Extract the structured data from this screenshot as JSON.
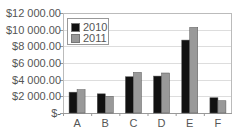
{
  "chart_data": {
    "type": "bar",
    "title": "",
    "xlabel": "",
    "ylabel": "",
    "categories": [
      "A",
      "B",
      "C",
      "D",
      "E",
      "F"
    ],
    "series": [
      {
        "name": "2010",
        "color": "#111111",
        "values": [
          2500,
          2300,
          4350,
          4430,
          8750,
          1830
        ]
      },
      {
        "name": "2011",
        "color": "#999999",
        "values": [
          2800,
          2000,
          4870,
          4800,
          10270,
          1470
        ]
      }
    ],
    "ylim": [
      0,
      12000
    ],
    "yticks": [
      0,
      2000,
      4000,
      6000,
      8000,
      10000,
      12000
    ],
    "ytick_labels": [
      "$-",
      "$2 000.00",
      "$4 000.00",
      "$6 000.00",
      "$8 000.00",
      "$10 000.00",
      "$12 000.00"
    ],
    "grid": true,
    "legend_position": "upper-left-inside"
  },
  "legend": {
    "items": [
      {
        "label": "2010"
      },
      {
        "label": "2011"
      }
    ]
  }
}
